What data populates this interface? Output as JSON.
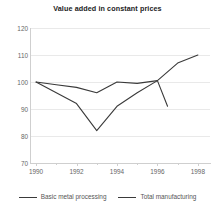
{
  "chart_data": {
    "type": "line",
    "title": "Value added in constant prices",
    "xlabel": "",
    "ylabel": "",
    "xlim": [
      1989.7,
      1998.6
    ],
    "ylim": [
      70,
      120
    ],
    "yticks": [
      70,
      80,
      90,
      100,
      110,
      120
    ],
    "xticks": [
      1990,
      1992,
      1994,
      1996,
      1998
    ],
    "xticks_minor": [
      1991,
      1993,
      1995,
      1997
    ],
    "grid": "horizontal",
    "legend_position": "bottom",
    "series": [
      {
        "name": "Basic metal processing",
        "color": "#3a3a3a",
        "x": [
          1990,
          1991,
          1992,
          1993,
          1994,
          1995,
          1996,
          1997,
          1998
        ],
        "y": [
          100,
          99,
          98,
          96,
          100,
          99.5,
          100.5,
          107,
          110
        ]
      },
      {
        "name": "Total manufacturing",
        "color": "#3a3a3a",
        "x": [
          1990,
          1991,
          1992,
          1993,
          1994,
          1995,
          1996,
          1996.5
        ],
        "y": [
          100,
          96,
          92,
          82,
          91,
          96,
          100.5,
          91
        ]
      }
    ]
  },
  "legend": {
    "items": [
      {
        "label": "Basic metal processing"
      },
      {
        "label": "Total manufacturing"
      }
    ]
  }
}
